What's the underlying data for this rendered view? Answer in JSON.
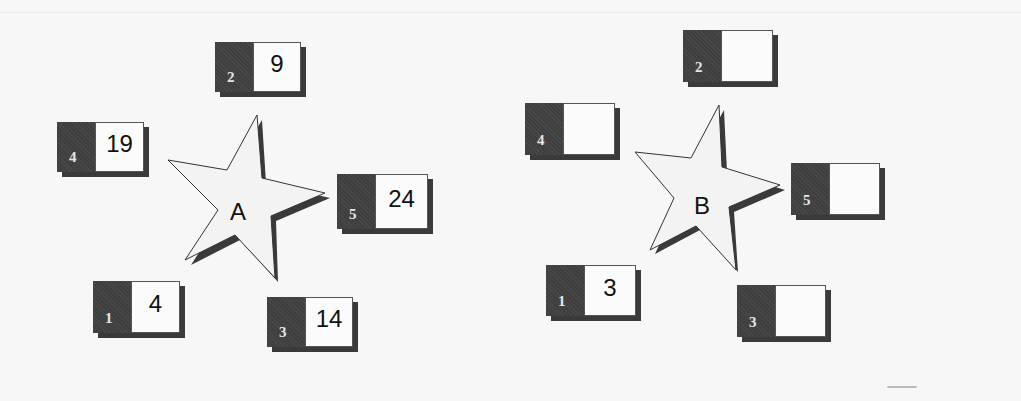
{
  "diagram": {
    "type": "star-with-numbered-boxes",
    "colors": {
      "background": "#f7f7f7",
      "tab": "#3f3f3f",
      "value_box": "#fbfbfb",
      "star_fill": "#f3f3f3",
      "star_shadow": "#3a3a3a"
    },
    "clusters": [
      {
        "star_label": "A",
        "boxes": [
          {
            "index": "2",
            "value": "9"
          },
          {
            "index": "4",
            "value": "19"
          },
          {
            "index": "5",
            "value": "24"
          },
          {
            "index": "1",
            "value": "4"
          },
          {
            "index": "3",
            "value": "14"
          }
        ]
      },
      {
        "star_label": "B",
        "boxes": [
          {
            "index": "2",
            "value": ""
          },
          {
            "index": "4",
            "value": ""
          },
          {
            "index": "5",
            "value": ""
          },
          {
            "index": "1",
            "value": "3"
          },
          {
            "index": "3",
            "value": ""
          }
        ]
      }
    ]
  }
}
